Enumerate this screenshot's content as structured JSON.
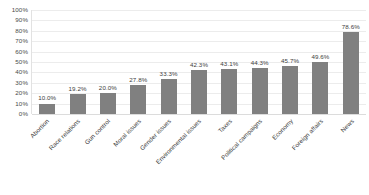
{
  "chart_data": {
    "type": "bar",
    "title": "",
    "subtitle": "",
    "xlabel": "",
    "ylabel": "",
    "ylim": [
      0,
      100
    ],
    "grid": true,
    "legend": false,
    "orientation": "vertical",
    "bar_color": "#808080",
    "value_suffix": "%",
    "y_ticks": [
      "100%",
      "90%",
      "80%",
      "70%",
      "60%",
      "50%",
      "40%",
      "30%",
      "20%",
      "10%",
      "0%"
    ],
    "y_tick_values": [
      100,
      90,
      80,
      70,
      60,
      50,
      40,
      30,
      20,
      10,
      0
    ],
    "categories": [
      "Abortion",
      "Race relations",
      "Gun control",
      "Moral issues",
      "Gender issues",
      "Environmental issues",
      "Taxes",
      "Political campaigns",
      "Economy",
      "Foreign affairs",
      "News"
    ],
    "values": [
      10.0,
      19.2,
      20.0,
      27.8,
      33.3,
      42.3,
      43.1,
      44.3,
      45.7,
      49.6,
      78.6
    ],
    "data_labels": [
      "10.0%",
      "19.2%",
      "20.0%",
      "27.8%",
      "33.3%",
      "42.3%",
      "43.1%",
      "44.3%",
      "45.7%",
      "49.6%",
      "78.6%"
    ]
  }
}
